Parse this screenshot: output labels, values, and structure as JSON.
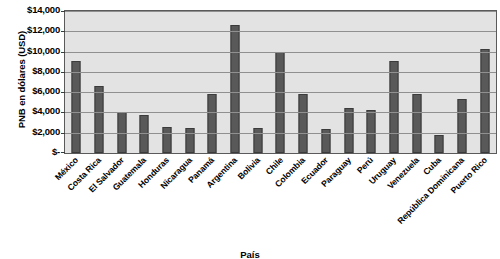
{
  "chart_data": {
    "type": "bar",
    "title": "",
    "xlabel": "País",
    "ylabel": "PNB en dólares (USD)",
    "ylim": [
      0,
      14000
    ],
    "ytick_values": [
      0,
      2000,
      4000,
      6000,
      8000,
      10000,
      12000,
      14000
    ],
    "ytick_labels": [
      "$-",
      "$2,000",
      "$4,000",
      "$6,000",
      "$8,000",
      "$10,000",
      "$12,000",
      "$14,000"
    ],
    "grid": true,
    "legend": false,
    "categories": [
      "México",
      "Costa Rica",
      "El Salvador",
      "Guatemala",
      "Honduras",
      "Nicaragua",
      "Panamá",
      "Argentina",
      "Bolivia",
      "Chile",
      "Colombia",
      "Ecuador",
      "Paraguay",
      "Perú",
      "Uruguay",
      "Venezuela",
      "Cuba",
      "República Dominicana",
      "Puerto Rico"
    ],
    "values": [
      9100,
      6600,
      4050,
      3700,
      2550,
      2500,
      5850,
      12650,
      2450,
      9950,
      5800,
      2350,
      4450,
      4250,
      9100,
      5850,
      1750,
      5300,
      10250
    ],
    "bar_color": "#595959",
    "plot_background": "#e3e3e3",
    "gridline_color": "#909090"
  }
}
